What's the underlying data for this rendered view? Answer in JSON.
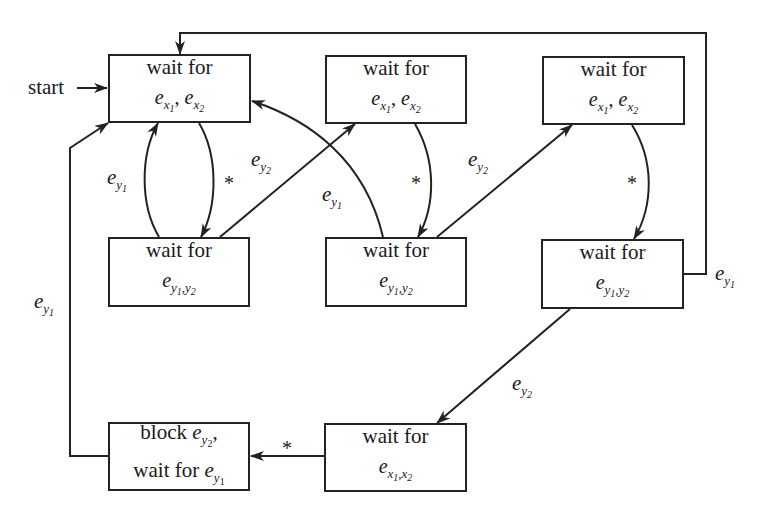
{
  "diagram": {
    "start_label": "start",
    "nodes": [
      {
        "id": "n1",
        "line1": "wait for",
        "line2": "e_x1 , e_x2",
        "x": 108,
        "y": 54,
        "w": 143,
        "h": 69
      },
      {
        "id": "n2",
        "line1": "wait for",
        "line2": "e_x1 , e_x2",
        "x": 325,
        "y": 55,
        "w": 142,
        "h": 69
      },
      {
        "id": "n3",
        "line1": "wait for",
        "line2": "e_x1 , e_x2",
        "x": 542,
        "y": 56,
        "w": 143,
        "h": 69
      },
      {
        "id": "n4",
        "line1": "wait for",
        "line2": "e_y1,y2",
        "x": 108,
        "y": 237,
        "w": 142,
        "h": 70
      },
      {
        "id": "n5",
        "line1": "wait for",
        "line2": "e_y1,y2",
        "x": 325,
        "y": 237,
        "w": 142,
        "h": 70
      },
      {
        "id": "n6",
        "line1": "wait for",
        "line2": "e_y1,y2",
        "x": 541,
        "y": 239,
        "w": 143,
        "h": 70
      },
      {
        "id": "n7",
        "line1": "block e_y2,",
        "line2": "wait for e_y1",
        "x": 108,
        "y": 422,
        "w": 142,
        "h": 69
      },
      {
        "id": "n8",
        "line1": "wait for",
        "line2": "e_x1,x2",
        "x": 324,
        "y": 423,
        "w": 143,
        "h": 69
      }
    ],
    "edges": [
      {
        "from": "start",
        "to": "n1",
        "label": ""
      },
      {
        "from": "n1",
        "to": "n4",
        "label": "*"
      },
      {
        "from": "n4",
        "to": "n1",
        "label": "e_y1"
      },
      {
        "from": "n4",
        "to": "n2",
        "label": "e_y2"
      },
      {
        "from": "n5",
        "to": "n1",
        "label": "e_y1"
      },
      {
        "from": "n2",
        "to": "n5",
        "label": "*"
      },
      {
        "from": "n5",
        "to": "n3",
        "label": "e_y2"
      },
      {
        "from": "n3",
        "to": "n6",
        "label": "*"
      },
      {
        "from": "n6",
        "to": "n1",
        "label": "e_y1"
      },
      {
        "from": "n6",
        "to": "n8",
        "label": "e_y2"
      },
      {
        "from": "n8",
        "to": "n7",
        "label": "*"
      },
      {
        "from": "n7",
        "to": "n1",
        "label": "e_y1"
      }
    ],
    "labels": {
      "star": "*",
      "e": "e",
      "x1": "x",
      "x2": "x",
      "y": "y",
      "sub1": "1",
      "sub2": "2",
      "comma": ",",
      "wait_for": "wait for",
      "block": "block"
    },
    "stroke_color": "#222222",
    "background": "#ffffff"
  }
}
